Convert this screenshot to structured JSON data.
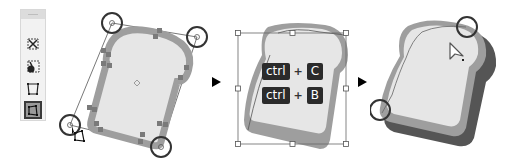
{
  "toolbar": {
    "tools": [
      {
        "name": "free-transform",
        "icon": "free-transform-icon"
      },
      {
        "name": "puppet-warp",
        "icon": "puppet-warp-icon"
      },
      {
        "name": "perspective-distort",
        "icon": "perspective-distort-icon"
      },
      {
        "name": "free-distort",
        "icon": "free-distort-icon",
        "selected": true
      }
    ]
  },
  "step1": {
    "description": "Rotated shape selected with free distort handles"
  },
  "step2": {
    "shortcuts": [
      {
        "modifier": "ctrl",
        "plus": "+",
        "key": "C"
      },
      {
        "modifier": "ctrl",
        "plus": "+",
        "key": "B"
      }
    ]
  },
  "step3": {
    "description": "Pasted in back, shadow offset"
  },
  "colors": {
    "shape_fill": "#e6e6e6",
    "shape_stroke": "#9e9e9e",
    "shadow": "#555555",
    "keycap_bg": "#2b2b2b",
    "keycap_text": "#ffffff",
    "handle_circle": "#333333"
  }
}
